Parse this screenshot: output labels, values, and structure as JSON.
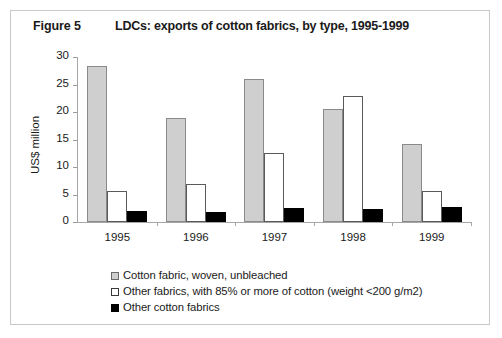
{
  "figure": {
    "number_label": "Figure 5",
    "title": "LDCs: exports of cotton fabrics, by type, 1995-1999"
  },
  "chart_data": {
    "type": "bar",
    "title": "LDCs: exports of cotton fabrics, by type, 1995-1999",
    "xlabel": "",
    "ylabel": "US$ million",
    "ylim": [
      0,
      30
    ],
    "ytick_labels": [
      "0",
      "5",
      "10",
      "15",
      "20",
      "25",
      "30"
    ],
    "yticks": [
      0,
      5,
      10,
      15,
      20,
      25,
      30
    ],
    "grid": false,
    "legend_position": "bottom-left",
    "categories": [
      "1995",
      "1996",
      "1997",
      "1998",
      "1999"
    ],
    "series": [
      {
        "name": "Cotton fabric, woven, unbleached",
        "color": "#cfcfcf",
        "values": [
          28.3,
          18.9,
          26.0,
          20.6,
          14.1
        ]
      },
      {
        "name": "Other fabrics, with 85% or more of cotton (weight <200 g/m2)",
        "color": "#ffffff",
        "values": [
          5.6,
          6.9,
          12.6,
          23.0,
          5.6
        ]
      },
      {
        "name": "Other cotton fabrics",
        "color": "#000000",
        "values": [
          2.0,
          1.9,
          2.6,
          2.4,
          2.7
        ]
      }
    ]
  }
}
